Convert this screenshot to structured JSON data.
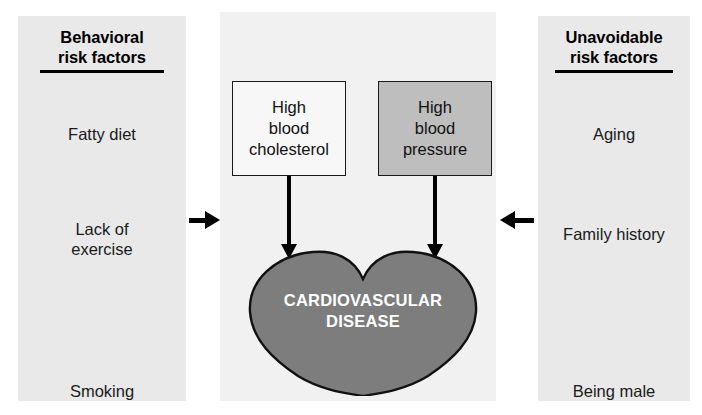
{
  "diagram": {
    "columns": {
      "left": {
        "header_line1": "Behavioral",
        "header_line2": "risk factors",
        "factors": [
          {
            "label": "Fatty diet"
          },
          {
            "label_line1": "Lack of",
            "label_line2": "exercise"
          },
          {
            "label": "Smoking"
          }
        ]
      },
      "right": {
        "header_line1": "Unavoidable",
        "header_line2": "risk factors",
        "factors": [
          {
            "label": "Aging"
          },
          {
            "label": "Family history"
          },
          {
            "label": "Being male"
          }
        ]
      }
    },
    "center": {
      "boxes": [
        {
          "name": "high-blood-cholesterol",
          "line1": "High",
          "line2": "blood",
          "line3": "cholesterol",
          "fill": "#f7f7f7",
          "border": "#1a1a1a"
        },
        {
          "name": "high-blood-pressure",
          "line1": "High",
          "line2": "blood",
          "line3": "pressure",
          "fill": "#bebebe",
          "border": "#1a1a1a"
        }
      ],
      "outcome": {
        "shape": "heart",
        "label_line1": "CARDIOVASCULAR",
        "label_line2": "DISEASE",
        "fill": "#7d7d7d",
        "stroke": "#111111",
        "text_color": "#ffffff"
      }
    },
    "arrows": {
      "left_inward": "arrow-right",
      "right_inward": "arrow-left",
      "cholesterol_to_heart": "arrow-down",
      "pressure_to_heart": "arrow-down"
    },
    "colors": {
      "side_panel_bg": "#e9e9e9",
      "center_panel_bg": "#f1f1f1",
      "ink": "#000000"
    }
  }
}
